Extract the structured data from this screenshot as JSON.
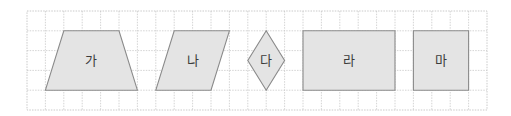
{
  "diagram": {
    "grid": {
      "columns": 25,
      "rows": 5
    },
    "colors": {
      "shape_fill": "#e4e4e4",
      "shape_stroke": "#8a8a8a",
      "grid_line": "#c9c9c9",
      "label": "#3c3c3c"
    },
    "shapes": [
      {
        "id": "ga",
        "label": "가",
        "kind": "trapezoid",
        "vertices": [
          [
            2,
            1
          ],
          [
            5,
            1
          ],
          [
            6,
            4
          ],
          [
            1,
            4
          ]
        ]
      },
      {
        "id": "na",
        "label": "나",
        "kind": "parallelogram",
        "vertices": [
          [
            8,
            1
          ],
          [
            11,
            1
          ],
          [
            10,
            4
          ],
          [
            7,
            4
          ]
        ]
      },
      {
        "id": "da",
        "label": "다",
        "kind": "rhombus",
        "vertices": [
          [
            13,
            1
          ],
          [
            14,
            2.5
          ],
          [
            13,
            4
          ],
          [
            12,
            2.5
          ]
        ]
      },
      {
        "id": "ra",
        "label": "라",
        "kind": "rectangle",
        "vertices": [
          [
            15,
            1
          ],
          [
            20,
            1
          ],
          [
            20,
            4
          ],
          [
            15,
            4
          ]
        ]
      },
      {
        "id": "ma",
        "label": "마",
        "kind": "square",
        "vertices": [
          [
            21,
            1
          ],
          [
            24,
            1
          ],
          [
            24,
            4
          ],
          [
            21,
            4
          ]
        ]
      }
    ]
  }
}
